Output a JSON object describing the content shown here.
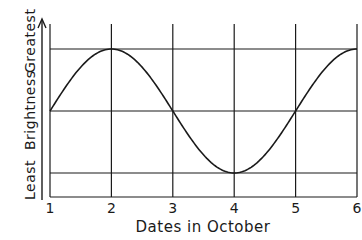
{
  "chart_data": {
    "type": "line",
    "title": "",
    "xlabel": "Dates in October",
    "ylabel": "Brightness",
    "y_end_labels": {
      "low": "Least",
      "high": "Greatest"
    },
    "x_ticks": [
      "1",
      "2",
      "3",
      "4",
      "5",
      "6"
    ],
    "x": [
      1,
      2,
      3,
      4,
      5,
      6
    ],
    "series": [
      {
        "name": "Brightness",
        "values": [
          0,
          1,
          0,
          -1,
          0,
          1
        ]
      }
    ],
    "y_gridlines": {
      "greatest": 1,
      "middle": 0,
      "least": -1
    },
    "xlim": [
      1,
      6
    ],
    "ylim": [
      -1.4,
      1.4
    ],
    "grid": true,
    "legend": null,
    "curve_shape": "sinusoid, period 4 days, peak on Oct 2 and 6, minimum on Oct 4"
  },
  "colors": {
    "line": "#1a1a1a",
    "background": "#ffffff"
  }
}
